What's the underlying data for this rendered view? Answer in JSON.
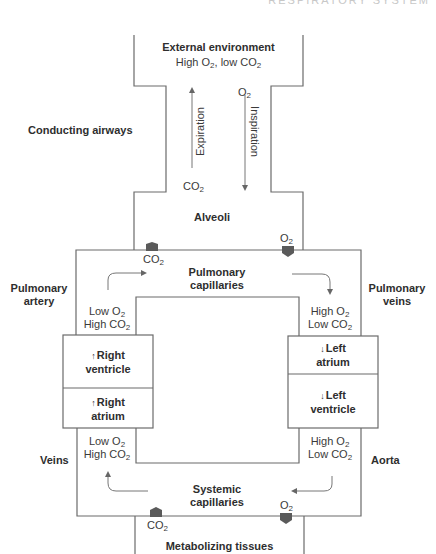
{
  "header": {
    "running_title": "RESPIRATORY SYSTEM"
  },
  "environment": {
    "title": "External environment",
    "subtitle_prefix": "High O",
    "subtitle_mid": ", low CO",
    "sub": "2"
  },
  "airways": {
    "label": "Conducting airways",
    "expiration": "Expiration",
    "inspiration": "Inspiration",
    "co2": "CO",
    "o2": "O",
    "sub": "2"
  },
  "alveoli": {
    "label": "Alveoli",
    "co2": "CO",
    "o2": "O",
    "sub": "2"
  },
  "pulmonary": {
    "capillaries_line1": "Pulmonary",
    "capillaries_line2": "capillaries",
    "artery_line1": "Pulmonary",
    "artery_line2": "artery",
    "veins_line1": "Pulmonary",
    "veins_line2": "veins"
  },
  "gas_levels": {
    "low_o2": "Low O",
    "high_co2": "High CO",
    "high_o2": "High O",
    "low_co2": "Low CO",
    "sub": "2"
  },
  "heart": {
    "right_ventricle_l1": "Right",
    "right_ventricle_l2": "ventricle",
    "right_atrium_l1": "Right",
    "right_atrium_l2": "atrium",
    "left_atrium_l1": "Left",
    "left_atrium_l2": "atrium",
    "left_ventricle_l1": "Left",
    "left_ventricle_l2": "ventricle",
    "up_arrow": "↑",
    "down_arrow": "↓"
  },
  "systemic": {
    "veins": "Veins",
    "aorta": "Aorta",
    "capillaries_line1": "Systemic",
    "capillaries_line2": "capillaries",
    "co2": "CO",
    "o2": "O",
    "sub": "2"
  },
  "tissues": {
    "label": "Metabolizing tissues"
  },
  "colors": {
    "line": "#6b6b6b",
    "marker": "#5a5a5a"
  }
}
